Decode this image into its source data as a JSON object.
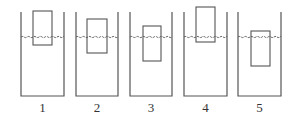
{
  "diagram": {
    "colors": {
      "stroke": "#555555",
      "water_line": "#555555",
      "label": "#333333",
      "background": "#ffffff"
    },
    "water_level_y": 37,
    "beakers": [
      {
        "label": "1",
        "left": 21,
        "right": 64,
        "top": 12,
        "bottom": 96,
        "block": {
          "x": 33,
          "y": 11,
          "w": 19,
          "h": 34
        }
      },
      {
        "label": "2",
        "left": 76,
        "right": 118,
        "top": 12,
        "bottom": 96,
        "block": {
          "x": 87,
          "y": 19,
          "w": 20,
          "h": 34
        }
      },
      {
        "label": "3",
        "left": 130,
        "right": 172,
        "top": 12,
        "bottom": 96,
        "block": {
          "x": 143,
          "y": 26,
          "w": 18,
          "h": 35
        }
      },
      {
        "label": "4",
        "left": 184,
        "right": 227,
        "top": 12,
        "bottom": 96,
        "block": {
          "x": 196,
          "y": 7,
          "w": 19,
          "h": 35
        }
      },
      {
        "label": "5",
        "left": 238,
        "right": 281,
        "top": 12,
        "bottom": 96,
        "block": {
          "x": 251,
          "y": 31,
          "w": 19,
          "h": 35
        }
      }
    ]
  }
}
